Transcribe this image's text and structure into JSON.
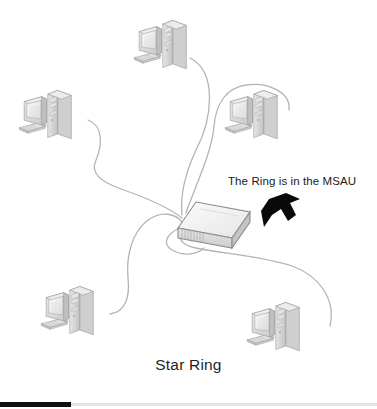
{
  "diagram": {
    "title": "Star Ring",
    "caption": "Star Ring",
    "type": "network-topology",
    "annotation": {
      "label": "The Ring is in the MSAU",
      "arrow_name": "arrow-pointing-to-msau",
      "arrow_direction": "down-left",
      "arrow_color": "#0a0a0a"
    },
    "hub": {
      "name": "MSAU",
      "full_name": "Multistation Access Unit",
      "x": 178,
      "y": 205,
      "width": 72,
      "height": 48,
      "port_count": 8,
      "top_color": "#f2f2f2",
      "front_color": "#dcdcdc",
      "side_color": "#c8c8c8",
      "outline_color": "#8e8e8e"
    },
    "cable": {
      "color": "#b4b4b4",
      "width": 1.3,
      "count": 6
    },
    "workstations": [
      {
        "id": "ws-top",
        "position": "top-center",
        "x": 133,
        "y": 18,
        "scale": 0.62
      },
      {
        "id": "ws-left",
        "position": "mid-left",
        "x": 18,
        "y": 88,
        "scale": 0.62
      },
      {
        "id": "ws-right",
        "position": "mid-right",
        "x": 224,
        "y": 88,
        "scale": 0.62
      },
      {
        "id": "ws-bottom-left",
        "position": "bottom-left",
        "x": 40,
        "y": 284,
        "scale": 0.62
      },
      {
        "id": "ws-bottom-right",
        "position": "bottom-right",
        "x": 246,
        "y": 300,
        "scale": 0.62
      }
    ],
    "colors": {
      "background": "#ffffff",
      "text": "#1b1b1b",
      "monitor_body": "#d8d8d8",
      "monitor_screen": "#eeeeee",
      "tower_body": "#d2d2d2",
      "keyboard": "#dadada",
      "outline": "#9a9a9a",
      "footer_dark": "#101010",
      "footer_light": "#e3e3e3"
    }
  }
}
